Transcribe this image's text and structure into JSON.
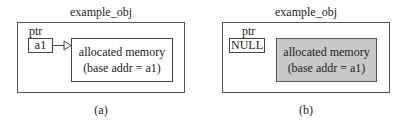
{
  "panels": [
    {
      "id": "a",
      "title": "example_obj",
      "ptr_label": "ptr",
      "ptr_value": "a1",
      "memory_line1": "allocated memory",
      "memory_line2": "(base addr = a1)",
      "memory_fill": "#ffffff",
      "has_arrow": true,
      "caption": "(a)"
    },
    {
      "id": "b",
      "title": "example_obj",
      "ptr_label": "ptr",
      "ptr_value": "NULL",
      "memory_line1": "allocated memory",
      "memory_line2": "(base addr = a1)",
      "memory_fill": "#c8c8c8",
      "has_arrow": false,
      "caption": "(b)"
    }
  ]
}
